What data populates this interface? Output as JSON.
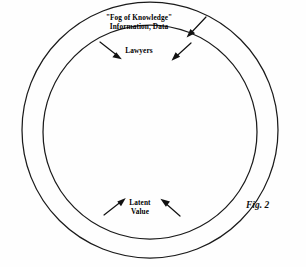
{
  "figure": {
    "caption": "Fig. 2",
    "background_color": "#fefefe",
    "stroke_color": "#1a1a1a",
    "labels": {
      "outer_ring_line1": "\"Fog of Knowledge\"",
      "outer_ring_line2": "Information, Data",
      "boundary_label": "Lawyers",
      "inner_core_line1": "Latent",
      "inner_core_line2": "Value"
    },
    "shapes": [
      {
        "name": "outer-circle",
        "type": "circle",
        "cx": 150,
        "cy": 130,
        "r": 128
      },
      {
        "name": "inner-circle",
        "type": "circle",
        "cx": 150,
        "cy": 132,
        "r": 107
      }
    ],
    "arrows": [
      {
        "name": "fog-arrow-right",
        "from": [
          206,
          17
        ],
        "to": [
          188,
          36
        ],
        "direction": "down-left",
        "points_to": "inner-circle"
      },
      {
        "name": "lawyers-arrow-left",
        "from": [
          100,
          42
        ],
        "to": [
          120,
          58
        ],
        "direction": "down-right",
        "points_to": "inner-circle"
      },
      {
        "name": "lawyers-arrow-right",
        "from": [
          191,
          43
        ],
        "to": [
          173,
          60
        ],
        "direction": "down-left",
        "points_to": "inner-circle"
      },
      {
        "name": "latent-arrow-left",
        "from": [
          104,
          215
        ],
        "to": [
          124,
          199
        ],
        "direction": "up-right",
        "points_to": "inner-circle"
      },
      {
        "name": "latent-arrow-right",
        "from": [
          180,
          216
        ],
        "to": [
          162,
          200
        ],
        "direction": "up-left",
        "points_to": "inner-circle"
      }
    ]
  }
}
